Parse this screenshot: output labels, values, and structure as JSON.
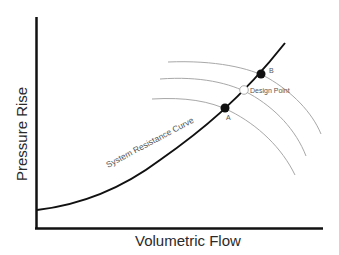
{
  "diagram": {
    "type": "fan-curve-vs-system-resistance",
    "x_axis_label": "Volumetric Flow",
    "y_axis_label": "Pressure Rise",
    "system_curve_label": "System Resistance  Curve",
    "points": {
      "a": {
        "label": "A",
        "style": "filled"
      },
      "design": {
        "label": "Design Point",
        "style": "open"
      },
      "b": {
        "label": "B",
        "style": "filled"
      }
    },
    "fan_curves": [
      {
        "name": "upper-fan-curve",
        "passes_through": "B"
      },
      {
        "name": "middle-fan-curve",
        "passes_through": "Design Point"
      },
      {
        "name": "lower-fan-curve",
        "passes_through": "A"
      }
    ],
    "colors": {
      "axis": "#111111",
      "system_curve": "#111111",
      "fan_curves": "#a8a8a8",
      "text": "#2a2a2a",
      "small_text": "#555555",
      "filled_point": "#111111",
      "open_point": "#ffffff"
    }
  }
}
